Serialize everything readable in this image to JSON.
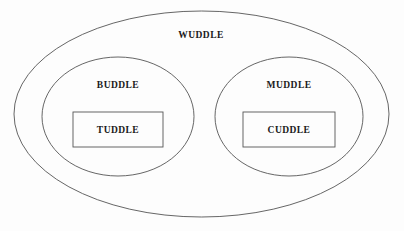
{
  "diagram": {
    "type": "nested-set-euler-diagram",
    "background_color": "#fdfdfd",
    "stroke_color": "#555555",
    "text_color": "#1a1a1a",
    "sets": [
      {
        "id": "wuddle",
        "label": "WUDDLE",
        "shape": "ellipse",
        "level": 0,
        "label_x": 201,
        "label_y": 35,
        "cx": 201.5,
        "cy": 114,
        "rx": 187.5,
        "ry": 103
      },
      {
        "id": "buddle",
        "label": "BUDDLE",
        "shape": "ellipse",
        "level": 1,
        "parent": "wuddle",
        "label_x": 118,
        "label_y": 85,
        "cx": 118,
        "cy": 116.5,
        "rx": 76,
        "ry": 59.5
      },
      {
        "id": "muddle",
        "label": "MUDDLE",
        "shape": "ellipse",
        "level": 1,
        "parent": "wuddle",
        "label_x": 289,
        "label_y": 85,
        "cx": 289,
        "cy": 116.5,
        "rx": 74,
        "ry": 59.5
      },
      {
        "id": "tuddle",
        "label": "TUDDLE",
        "shape": "rectangle",
        "level": 2,
        "parent": "buddle",
        "label_x": 118,
        "label_y": 129.5,
        "x": 73,
        "y": 112,
        "width": 90,
        "height": 35
      },
      {
        "id": "cuddle",
        "label": "CUDDLE",
        "shape": "rectangle",
        "level": 2,
        "parent": "muddle",
        "label_x": 289,
        "label_y": 129.5,
        "x": 243,
        "y": 112,
        "width": 92,
        "height": 35
      }
    ]
  }
}
